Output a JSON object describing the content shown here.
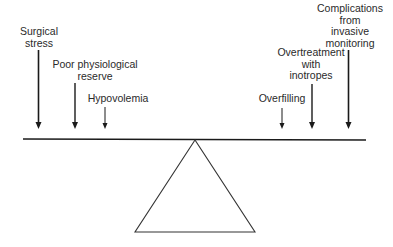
{
  "diagram": {
    "type": "balance-seesaw",
    "left_factors": [
      {
        "id": "surgical-stress",
        "lines": [
          "Surgical",
          "stress"
        ]
      },
      {
        "id": "poor-physiological-reserve",
        "lines": [
          "Poor physiological",
          "reserve"
        ]
      },
      {
        "id": "hypovolemia",
        "lines": [
          "Hypovolemia"
        ]
      }
    ],
    "right_factors": [
      {
        "id": "overfilling",
        "lines": [
          "Overfilling"
        ]
      },
      {
        "id": "overtreatment-with-inotropes",
        "lines": [
          "Overtreatment",
          "with",
          "inotropes"
        ]
      },
      {
        "id": "complications-from-invasive-monitoring",
        "lines": [
          "Complications",
          "from",
          "invasive",
          "monitoring"
        ]
      }
    ],
    "colors": {
      "line": "#1a1a1a",
      "text": "#2a2a2a",
      "background": "#ffffff"
    }
  }
}
